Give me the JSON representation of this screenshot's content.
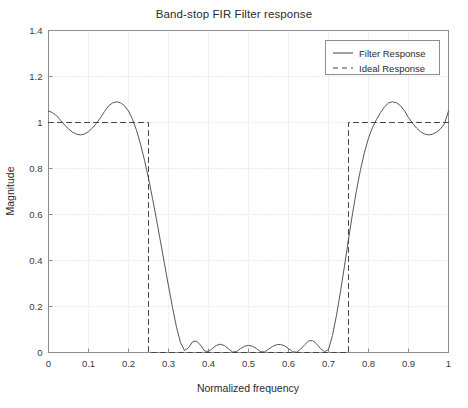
{
  "chart_data": {
    "type": "line",
    "title": "Band-stop FIR Filter response",
    "xlabel": "Normalized frequency",
    "ylabel": "Magnitude",
    "xlim": [
      0,
      1
    ],
    "ylim": [
      0,
      1.4
    ],
    "grid": true,
    "legend_position": "top-right",
    "xticks": [
      "0",
      "0.1",
      "0.2",
      "0.3",
      "0.4",
      "0.5",
      "0.6",
      "0.7",
      "0.8",
      "0.9",
      "1"
    ],
    "xtick_values": [
      0,
      0.1,
      0.2,
      0.3,
      0.4,
      0.5,
      0.6,
      0.7,
      0.8,
      0.9,
      1
    ],
    "yticks": [
      "0",
      "0.2",
      "0.4",
      "0.6",
      "0.8",
      "1",
      "1.2",
      "1.4"
    ],
    "ytick_values": [
      0,
      0.2,
      0.4,
      0.6,
      0.8,
      1.0,
      1.2,
      1.4
    ],
    "series": [
      {
        "name": "Filter Response",
        "style": "solid",
        "color": "#555555",
        "x": [
          0.0,
          0.01,
          0.02,
          0.03,
          0.04,
          0.05,
          0.06,
          0.07,
          0.08,
          0.09,
          0.1,
          0.11,
          0.12,
          0.13,
          0.14,
          0.15,
          0.16,
          0.17,
          0.18,
          0.19,
          0.2,
          0.21,
          0.22,
          0.23,
          0.24,
          0.25,
          0.26,
          0.27,
          0.28,
          0.29,
          0.3,
          0.31,
          0.32,
          0.33,
          0.34,
          0.35,
          0.36,
          0.37,
          0.38,
          0.39,
          0.4,
          0.41,
          0.42,
          0.43,
          0.44,
          0.45,
          0.46,
          0.47,
          0.48,
          0.49,
          0.5,
          0.51,
          0.52,
          0.53,
          0.54,
          0.55,
          0.56,
          0.57,
          0.58,
          0.59,
          0.6,
          0.61,
          0.62,
          0.63,
          0.64,
          0.65,
          0.66,
          0.67,
          0.68,
          0.69,
          0.7,
          0.71,
          0.72,
          0.73,
          0.74,
          0.75,
          0.76,
          0.77,
          0.78,
          0.79,
          0.8,
          0.81,
          0.82,
          0.83,
          0.84,
          0.85,
          0.86,
          0.87,
          0.88,
          0.89,
          0.9,
          0.91,
          0.92,
          0.93,
          0.94,
          0.95,
          0.96,
          0.97,
          0.98,
          0.99,
          1.0
        ],
        "y": [
          1.05,
          1.043,
          1.03,
          1.01,
          0.99,
          0.972,
          0.958,
          0.949,
          0.946,
          0.95,
          0.96,
          0.976,
          0.997,
          1.021,
          1.048,
          1.072,
          1.085,
          1.09,
          1.086,
          1.073,
          1.05,
          1.014,
          0.966,
          0.906,
          0.836,
          0.757,
          0.67,
          0.578,
          0.482,
          0.385,
          0.289,
          0.196,
          0.11,
          0.043,
          0.009,
          0.021,
          0.046,
          0.05,
          0.032,
          0.007,
          0.004,
          0.018,
          0.031,
          0.036,
          0.03,
          0.016,
          0.002,
          0.004,
          0.017,
          0.027,
          0.031,
          0.027,
          0.017,
          0.004,
          0.002,
          0.014,
          0.026,
          0.034,
          0.035,
          0.029,
          0.017,
          0.004,
          0.001,
          0.014,
          0.033,
          0.05,
          0.052,
          0.038,
          0.017,
          0.003,
          0.013,
          0.075,
          0.162,
          0.265,
          0.377,
          0.492,
          0.603,
          0.705,
          0.795,
          0.871,
          0.932,
          0.979,
          1.013,
          1.043,
          1.068,
          1.085,
          1.09,
          1.086,
          1.073,
          1.051,
          1.021,
          0.997,
          0.976,
          0.96,
          0.95,
          0.946,
          0.949,
          0.958,
          0.972,
          0.995,
          1.05
        ]
      },
      {
        "name": "Ideal Response",
        "style": "dashed",
        "color": "#444444",
        "x": [
          0.0,
          0.25,
          0.25,
          0.75,
          0.75,
          1.0
        ],
        "y": [
          1.0,
          1.0,
          0.0,
          0.0,
          1.0,
          1.0
        ]
      }
    ],
    "annotations": {
      "passband_ripple_peak": 1.09,
      "passband_ripple_trough": 0.946,
      "stopband_edges": [
        0.25,
        0.75
      ],
      "stopband_ripple_peak": 0.052
    }
  },
  "legend": {
    "entries": [
      {
        "label": "Filter Response",
        "style": "solid"
      },
      {
        "label": "Ideal Response",
        "style": "dashed"
      }
    ]
  }
}
